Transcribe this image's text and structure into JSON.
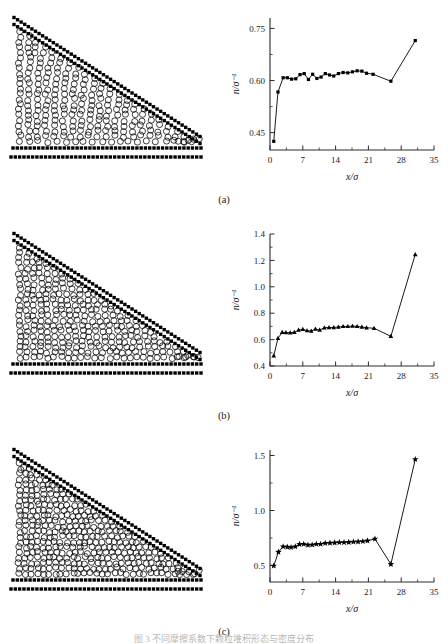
{
  "figure": {
    "caption": "图 3 不同摩擦系数下颗粒堆积形态与密度分布",
    "panel_labels": [
      "(a)",
      "(b)",
      "(c)"
    ]
  },
  "simulation": {
    "wall_marker": "black-square",
    "particle_marker": "open-circle",
    "description": "granular wedge heap bounded by square-particle walls",
    "panels": [
      {
        "label": "(a)",
        "particle_count": 300,
        "fill_fraction": 0.62
      },
      {
        "label": "(b)",
        "particle_count": 420,
        "fill_fraction": 0.78
      },
      {
        "label": "(c)",
        "particle_count": 500,
        "fill_fraction": 0.9
      }
    ]
  },
  "chart_data": [
    {
      "type": "line",
      "title": "(a)",
      "marker": "square",
      "xlabel": "x/σ",
      "ylabel": "n/σ⁻¹",
      "xlim": [
        0,
        35
      ],
      "ylim": [
        0.4,
        0.78
      ],
      "xticks": [
        0,
        7,
        14,
        21,
        28,
        35
      ],
      "xtick_labels": [
        "0",
        "7",
        "14",
        "21",
        "28",
        "35"
      ],
      "yticks": [
        0.45,
        0.6,
        0.75
      ],
      "ytick_labels": [
        "0.45",
        "0.60",
        "0.75"
      ],
      "grid": false,
      "x": [
        0.8,
        1.7,
        2.8,
        3.7,
        4.6,
        5.5,
        6.4,
        7.3,
        8.2,
        9.1,
        10.0,
        10.9,
        11.8,
        12.7,
        13.6,
        14.6,
        15.6,
        16.6,
        17.6,
        18.6,
        19.6,
        20.6,
        22.0,
        25.8,
        31.0
      ],
      "y": [
        0.425,
        0.567,
        0.608,
        0.608,
        0.604,
        0.605,
        0.617,
        0.62,
        0.603,
        0.618,
        0.606,
        0.61,
        0.62,
        0.616,
        0.613,
        0.62,
        0.623,
        0.622,
        0.625,
        0.628,
        0.627,
        0.621,
        0.618,
        0.598,
        0.715
      ]
    },
    {
      "type": "line",
      "title": "(b)",
      "marker": "triangle",
      "xlabel": "x/σ",
      "ylabel": "n/σ⁻¹",
      "xlim": [
        0,
        35
      ],
      "ylim": [
        0.4,
        1.4
      ],
      "xticks": [
        0,
        7,
        14,
        21,
        28,
        35
      ],
      "xtick_labels": [
        "0",
        "7",
        "14",
        "21",
        "28",
        "35"
      ],
      "yticks": [
        0.4,
        0.6,
        0.8,
        1.0,
        1.2,
        1.4
      ],
      "ytick_labels": [
        "0.4",
        "0.6",
        "0.8",
        "1.0",
        "1.2",
        "1.4"
      ],
      "grid": false,
      "x": [
        0.8,
        1.7,
        2.6,
        3.4,
        4.3,
        5.2,
        6.1,
        7.0,
        7.9,
        8.8,
        9.7,
        10.6,
        11.6,
        12.6,
        13.6,
        14.6,
        15.6,
        16.6,
        17.6,
        18.6,
        19.6,
        20.6,
        22.2,
        25.8,
        31.0
      ],
      "y": [
        0.478,
        0.61,
        0.655,
        0.654,
        0.652,
        0.655,
        0.672,
        0.678,
        0.668,
        0.665,
        0.68,
        0.672,
        0.69,
        0.692,
        0.692,
        0.695,
        0.7,
        0.7,
        0.702,
        0.7,
        0.695,
        0.69,
        0.686,
        0.625,
        1.245
      ]
    },
    {
      "type": "line",
      "title": "(c)",
      "marker": "star",
      "xlabel": "x/σ",
      "ylabel": "n/σ⁻¹",
      "xlim": [
        0,
        35
      ],
      "ylim": [
        0.35,
        1.55
      ],
      "xticks": [
        0,
        7,
        14,
        21,
        28,
        35
      ],
      "xtick_labels": [
        "0",
        "7",
        "14",
        "21",
        "28",
        "35"
      ],
      "yticks": [
        0.5,
        1.0,
        1.5
      ],
      "ytick_labels": [
        "0.5",
        "1.0",
        "1.5"
      ],
      "grid": false,
      "x": [
        0.8,
        1.8,
        2.8,
        3.7,
        4.5,
        5.4,
        6.3,
        7.2,
        8.1,
        9.0,
        9.9,
        10.8,
        11.8,
        12.8,
        13.8,
        14.8,
        15.8,
        16.8,
        17.8,
        18.8,
        19.8,
        20.8,
        22.4,
        25.8,
        31.0
      ],
      "y": [
        0.497,
        0.623,
        0.672,
        0.668,
        0.665,
        0.672,
        0.693,
        0.695,
        0.686,
        0.688,
        0.695,
        0.695,
        0.703,
        0.705,
        0.707,
        0.71,
        0.71,
        0.712,
        0.715,
        0.716,
        0.72,
        0.725,
        0.742,
        0.512,
        1.465
      ]
    }
  ]
}
